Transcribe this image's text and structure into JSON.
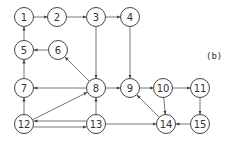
{
  "figure_label": "(b)",
  "colors": {
    "stroke": "#444444",
    "background": "#ffffff",
    "text": "#333333"
  },
  "nodes": [
    {
      "id": "1",
      "label": "1"
    },
    {
      "id": "2",
      "label": "2"
    },
    {
      "id": "3",
      "label": "3"
    },
    {
      "id": "4",
      "label": "4"
    },
    {
      "id": "5",
      "label": "5"
    },
    {
      "id": "6",
      "label": "6"
    },
    {
      "id": "7",
      "label": "7"
    },
    {
      "id": "8",
      "label": "8"
    },
    {
      "id": "9",
      "label": "9"
    },
    {
      "id": "10",
      "label": "10"
    },
    {
      "id": "11",
      "label": "11"
    },
    {
      "id": "12",
      "label": "12"
    },
    {
      "id": "13",
      "label": "13"
    },
    {
      "id": "14",
      "label": "14"
    },
    {
      "id": "15",
      "label": "15"
    }
  ],
  "edges": [
    {
      "from": "1",
      "to": "2"
    },
    {
      "from": "2",
      "to": "3"
    },
    {
      "from": "3",
      "to": "4"
    },
    {
      "from": "5",
      "to": "1"
    },
    {
      "from": "6",
      "to": "5"
    },
    {
      "from": "7",
      "to": "5"
    },
    {
      "from": "3",
      "to": "8"
    },
    {
      "from": "4",
      "to": "9"
    },
    {
      "from": "8",
      "to": "6"
    },
    {
      "from": "8",
      "to": "7"
    },
    {
      "from": "8",
      "to": "9"
    },
    {
      "from": "9",
      "to": "10"
    },
    {
      "from": "10",
      "to": "11"
    },
    {
      "from": "10",
      "to": "14"
    },
    {
      "from": "11",
      "to": "15"
    },
    {
      "from": "15",
      "to": "14"
    },
    {
      "from": "14",
      "to": "9"
    },
    {
      "from": "12",
      "to": "7"
    },
    {
      "from": "12",
      "to": "8"
    },
    {
      "from": "13",
      "to": "12"
    },
    {
      "from": "12",
      "to": "13"
    },
    {
      "from": "13",
      "to": "8"
    },
    {
      "from": "13",
      "to": "14"
    }
  ]
}
